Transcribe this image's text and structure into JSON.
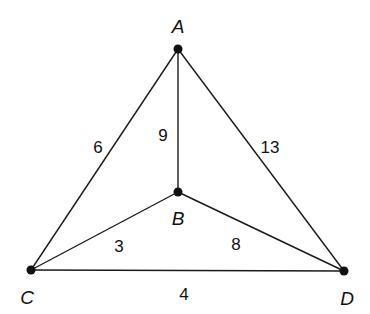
{
  "diagram": {
    "type": "weighted-graph",
    "nodes": [
      {
        "id": "A",
        "label": "A",
        "x": 178,
        "y": 49,
        "label_x": 178,
        "label_y": 28
      },
      {
        "id": "B",
        "label": "B",
        "x": 178,
        "y": 192,
        "label_x": 178,
        "label_y": 220
      },
      {
        "id": "C",
        "label": "C",
        "x": 31,
        "y": 270,
        "label_x": 27,
        "label_y": 299
      },
      {
        "id": "D",
        "label": "D",
        "x": 344,
        "y": 271,
        "label_x": 347,
        "label_y": 300
      }
    ],
    "edges": [
      {
        "from": "A",
        "to": "C",
        "weight": "6",
        "label_x": 98,
        "label_y": 149
      },
      {
        "from": "A",
        "to": "B",
        "weight": "9",
        "label_x": 163,
        "label_y": 137
      },
      {
        "from": "A",
        "to": "D",
        "weight": "13",
        "label_x": 270,
        "label_y": 149
      },
      {
        "from": "B",
        "to": "C",
        "weight": "3",
        "label_x": 119,
        "label_y": 248
      },
      {
        "from": "B",
        "to": "D",
        "weight": "8",
        "label_x": 236,
        "label_y": 246
      },
      {
        "from": "C",
        "to": "D",
        "weight": "4",
        "label_x": 184,
        "label_y": 296
      }
    ]
  }
}
